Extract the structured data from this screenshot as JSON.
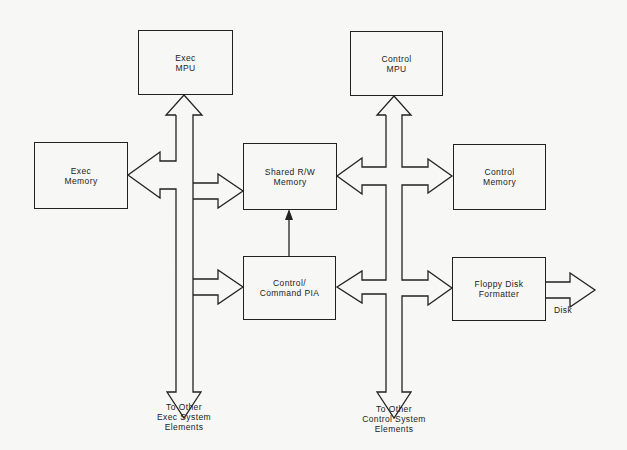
{
  "diagram": {
    "type": "block-diagram",
    "blocks": {
      "exec_mpu": {
        "label": "Exec\nMPU"
      },
      "control_mpu": {
        "label": "Control\nMPU"
      },
      "exec_memory": {
        "label": "Exec\nMemory"
      },
      "shared_memory": {
        "label": "Shared R/W\nMemory"
      },
      "control_memory": {
        "label": "Control\nMemory"
      },
      "pia": {
        "label": "Control/\nCommand PIA"
      },
      "fdc": {
        "label": "Floppy Disk\nFormatter"
      }
    },
    "labels": {
      "disk": "Disk",
      "exec_other": "To Other\nExec System\nElements",
      "control_other": "To Other\nControl System\nElements"
    },
    "connections": [
      {
        "from": "exec_bus",
        "to": "exec_mpu",
        "type": "bus-arrow"
      },
      {
        "from": "exec_bus",
        "to": "exec_memory",
        "type": "bidirectional-bus"
      },
      {
        "from": "exec_bus",
        "to": "shared_memory",
        "type": "bus-arrow"
      },
      {
        "from": "exec_bus",
        "to": "pia",
        "type": "bus-arrow"
      },
      {
        "from": "control_bus",
        "to": "control_mpu",
        "type": "bus-arrow"
      },
      {
        "from": "control_bus",
        "to": "shared_memory",
        "type": "bidirectional-bus"
      },
      {
        "from": "control_bus",
        "to": "control_memory",
        "type": "bus-arrow"
      },
      {
        "from": "control_bus",
        "to": "pia",
        "type": "bidirectional-bus"
      },
      {
        "from": "control_bus",
        "to": "fdc",
        "type": "bus-arrow"
      },
      {
        "from": "pia",
        "to": "shared_memory",
        "type": "line-arrow"
      },
      {
        "from": "fdc",
        "to": "disk",
        "type": "bus-arrow"
      }
    ],
    "colors": {
      "line": "#222222",
      "background": "#f7f7f5"
    }
  }
}
